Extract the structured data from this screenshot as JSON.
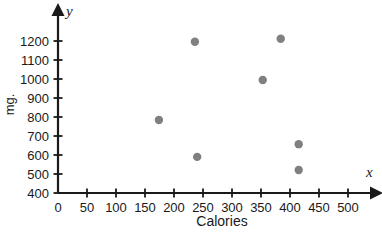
{
  "chart_data": {
    "type": "scatter",
    "title": "",
    "xlabel": "Calories",
    "ylabel": "mg.",
    "x_axis_name": "x",
    "y_axis_name": "y",
    "xlim": [
      0,
      550
    ],
    "ylim": [
      400,
      1250
    ],
    "grid": false,
    "legend": null,
    "xticks": [
      0,
      50,
      100,
      150,
      200,
      250,
      300,
      350,
      400,
      450,
      500
    ],
    "xtick_labels": [
      "0",
      "50",
      "100",
      "150",
      "200",
      "250",
      "300",
      "350",
      "400",
      "450",
      "500"
    ],
    "yticks": [
      400,
      500,
      600,
      700,
      800,
      900,
      1000,
      1100,
      1200
    ],
    "ytick_labels": [
      "400",
      "500",
      "600",
      "700",
      "800",
      "900",
      "1000",
      "1100",
      "1200"
    ],
    "points": [
      {
        "x": 174,
        "y": 784
      },
      {
        "x": 236,
        "y": 1196
      },
      {
        "x": 240,
        "y": 590
      },
      {
        "x": 353,
        "y": 995
      },
      {
        "x": 384,
        "y": 1212
      },
      {
        "x": 415,
        "y": 657
      },
      {
        "x": 415,
        "y": 521
      }
    ],
    "marker_color": "#808080",
    "marker_size": 4.2,
    "axis_color": "#1a1a1a"
  }
}
